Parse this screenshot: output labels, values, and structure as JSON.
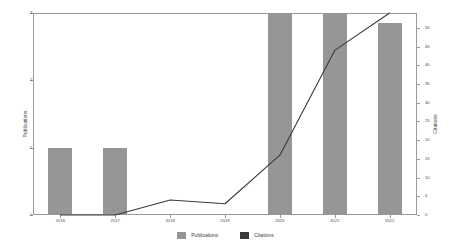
{
  "chart_data": {
    "type": "bar",
    "title": "",
    "subtitle": "",
    "xlabel": "",
    "ylabel": "Publications",
    "y2label": "Citations",
    "categories": [
      "2016",
      "2017",
      "2018",
      "2019",
      "2020",
      "2021",
      "2022"
    ],
    "series": [
      {
        "name": "Publications",
        "type": "bar",
        "axis": "left",
        "color": "#969696",
        "values": [
          1,
          1,
          0,
          0,
          3,
          3,
          2.85
        ]
      },
      {
        "name": "Citations",
        "type": "line",
        "axis": "right",
        "color": "#3a3a3a",
        "values": [
          0,
          0,
          4,
          3,
          16,
          44,
          54
        ]
      }
    ],
    "ylim": [
      0,
      3
    ],
    "y2lim": [
      0,
      54
    ],
    "yticks": [
      "0",
      "1",
      "2",
      "3"
    ],
    "ytick_values": [
      0,
      1,
      2,
      3
    ],
    "y2ticks": [
      "0",
      "5",
      "10",
      "15",
      "20",
      "25",
      "30",
      "35",
      "40",
      "45",
      "50"
    ],
    "y2tick_values": [
      0,
      5,
      10,
      15,
      20,
      25,
      30,
      35,
      40,
      45,
      50
    ],
    "grid": false,
    "legend_position": "bottom-center",
    "legend": [
      {
        "label": "Publications",
        "color": "#969696"
      },
      {
        "label": "Citations",
        "color": "#3a3a3a"
      }
    ],
    "background": "#ffffff",
    "axis_color": "#9a9a9a"
  }
}
